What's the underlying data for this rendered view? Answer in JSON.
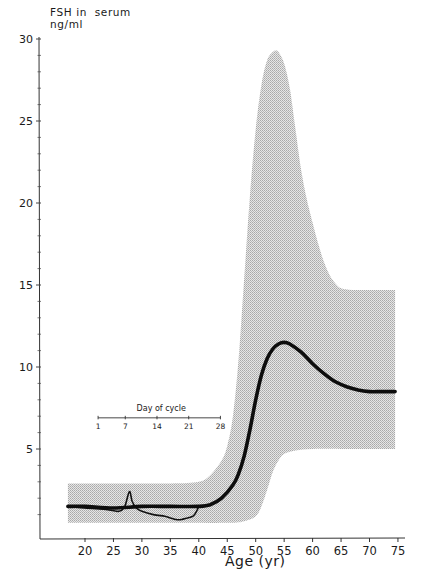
{
  "chart_data": {
    "type": "area",
    "title": "",
    "ylabel_line1": "FSH in  serum",
    "ylabel_line2": "ng/ml",
    "xlabel": "Age (yr)",
    "xlim": [
      17,
      75
    ],
    "ylim": [
      0,
      30
    ],
    "grid": false,
    "x_ticks": [
      20,
      25,
      30,
      35,
      40,
      45,
      50,
      55,
      60,
      65,
      70,
      75
    ],
    "y_ticks": [
      5,
      10,
      15,
      20,
      25,
      30
    ],
    "series": [
      {
        "name": "Mean FSH",
        "style": "thick-line",
        "x": [
          17,
          20,
          25,
          30,
          35,
          40,
          42,
          44,
          46,
          47,
          48,
          49,
          50,
          51,
          52,
          53,
          54,
          55,
          56,
          58,
          60,
          62,
          64,
          66,
          68,
          70,
          72,
          74.5
        ],
        "values": [
          1.5,
          1.5,
          1.4,
          1.5,
          1.5,
          1.5,
          1.6,
          2.0,
          2.8,
          3.5,
          4.6,
          6.2,
          8.0,
          9.5,
          10.5,
          11.1,
          11.4,
          11.5,
          11.4,
          10.9,
          10.2,
          9.6,
          9.1,
          8.8,
          8.6,
          8.5,
          8.5,
          8.5
        ]
      },
      {
        "name": "Range upper bound",
        "style": "shaded-band-top",
        "x": [
          17,
          25,
          35,
          40,
          42,
          44,
          45,
          46,
          47,
          48,
          49,
          50,
          51,
          52,
          53,
          53.5,
          54,
          55,
          56,
          57,
          58,
          59,
          60,
          61,
          62,
          63,
          64,
          65,
          67,
          70,
          74.5
        ],
        "values": [
          2.9,
          2.9,
          2.9,
          3.0,
          3.4,
          4.3,
          5.2,
          7.0,
          10.5,
          15.5,
          20.5,
          24.5,
          27.2,
          28.7,
          29.2,
          29.3,
          29.2,
          28.5,
          27.0,
          24.5,
          22.0,
          20.2,
          18.8,
          17.5,
          16.4,
          15.6,
          15.1,
          14.8,
          14.7,
          14.7,
          14.7
        ]
      },
      {
        "name": "Range lower bound",
        "style": "shaded-band-bottom",
        "x": [
          17,
          25,
          35,
          45,
          48,
          50,
          51,
          52,
          53,
          54,
          55,
          57,
          60,
          65,
          70,
          74.5
        ],
        "values": [
          0.5,
          0.5,
          0.5,
          0.5,
          0.6,
          0.9,
          1.5,
          2.5,
          3.6,
          4.3,
          4.7,
          4.9,
          5.0,
          5.0,
          5.0,
          5.0
        ]
      },
      {
        "name": "Single menstrual cycle (inset)",
        "style": "thin-line",
        "x": [
          17,
          20,
          24,
          26,
          27,
          27.8,
          28.3,
          29,
          30,
          32,
          34,
          35,
          36,
          37,
          38,
          39,
          39.6,
          40
        ],
        "values": [
          1.5,
          1.4,
          1.3,
          1.2,
          1.5,
          2.4,
          1.8,
          1.4,
          1.2,
          1.0,
          0.9,
          0.8,
          0.7,
          0.7,
          0.8,
          0.9,
          1.2,
          1.5
        ]
      }
    ],
    "inset_axis": {
      "label": "Day of cycle",
      "ticks": [
        "1",
        "7",
        "14",
        "21",
        "28"
      ],
      "x_start_age": 22.3,
      "x_end_age": 43.8,
      "y_value": 6.9
    },
    "legend": "none"
  }
}
